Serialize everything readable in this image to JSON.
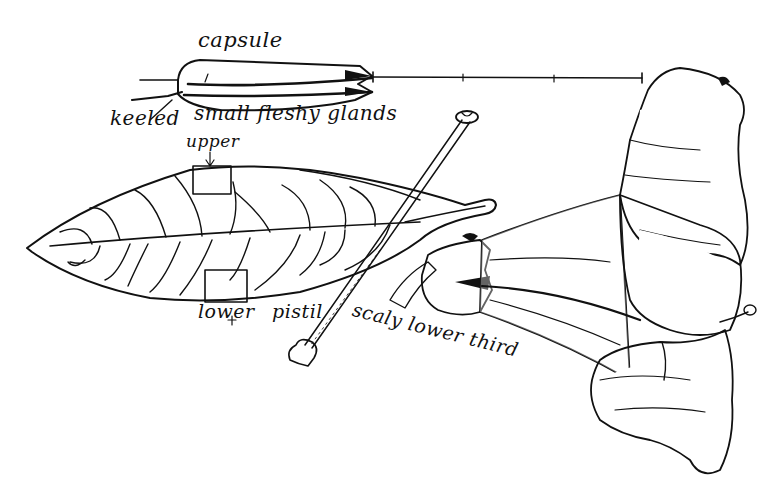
{
  "figure": {
    "colors": {
      "ink": "#111111",
      "paper": "#ffffff"
    },
    "labels": {
      "capsule": "capsule",
      "keeled": "keeled",
      "glands": "small fleshy glands",
      "upper": "upper",
      "lower": "lower",
      "pistil": "pistil",
      "scaly": "scaly lower third"
    },
    "parts": [
      "capsule",
      "leaf",
      "leaf-upper-surface-sample",
      "leaf-lower-surface-sample",
      "pistil",
      "flower",
      "scale-bar"
    ],
    "scale_bar": {
      "segments": 3
    }
  }
}
